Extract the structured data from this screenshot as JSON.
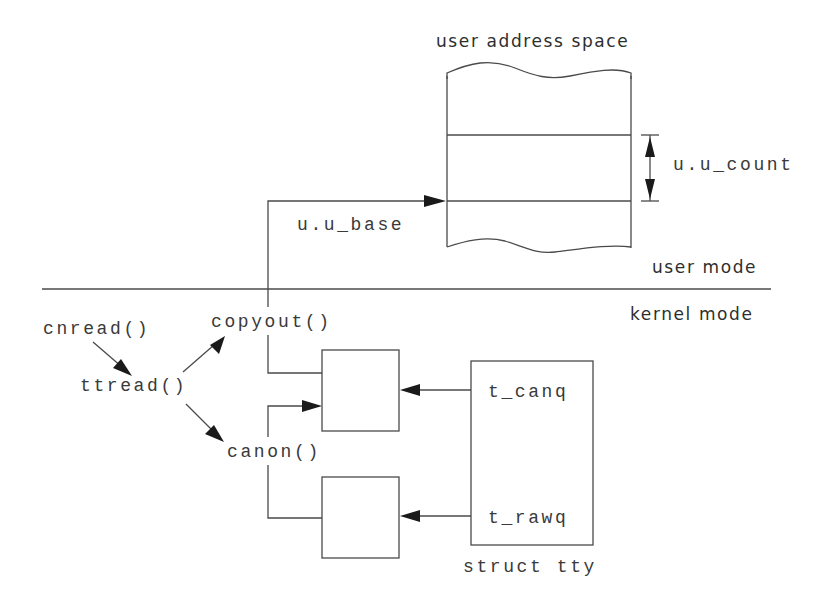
{
  "diagram": {
    "title": "user address space",
    "regions": {
      "user": "user mode",
      "kernel": "kernel mode"
    },
    "user_space": {
      "base_label": "u.u_base",
      "count_label": "u.u_count"
    },
    "functions": {
      "cnread": "cnread()",
      "ttread": "ttread()",
      "copyout": "copyout()",
      "canon": "canon()"
    },
    "tty": {
      "caption": "struct tty",
      "canq": "t_canq",
      "rawq": "t_rawq"
    },
    "flows": [
      {
        "from": "cnread()",
        "to": "ttread()"
      },
      {
        "from": "ttread()",
        "to": "copyout()"
      },
      {
        "from": "ttread()",
        "to": "canon()"
      },
      {
        "from": "copyout()",
        "to": "user address space (u.u_base)"
      },
      {
        "from": "canon()",
        "to": "canonical queue buffer"
      },
      {
        "from": "t_canq",
        "to": "canonical queue buffer"
      },
      {
        "from": "t_rawq",
        "to": "raw queue buffer"
      }
    ],
    "colors": {
      "line": "#4a4a4a",
      "text": "#3a3a3a",
      "background": "#ffffff"
    }
  }
}
